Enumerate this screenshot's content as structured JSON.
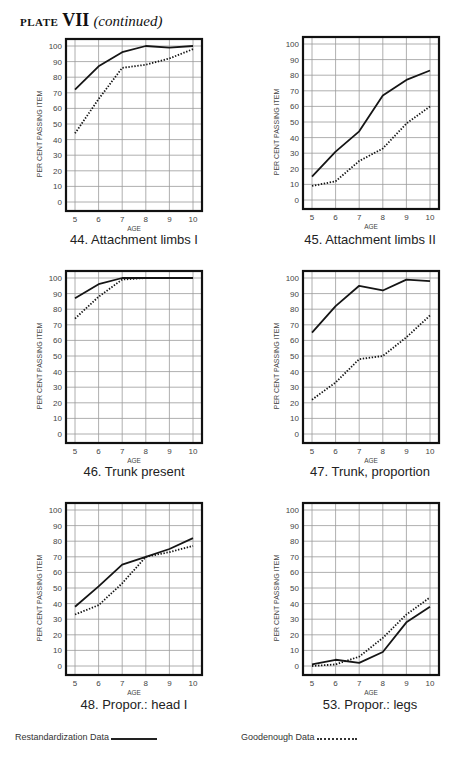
{
  "page": {
    "plate_label": "PLATE",
    "plate_number": "VII",
    "plate_suffix": "(continued)"
  },
  "legend": {
    "solid_label": "Restandardization Data",
    "dotted_label": "Goodenough Data"
  },
  "chart_data": [
    {
      "type": "line",
      "id": "44",
      "title": "44. Attachment limbs I",
      "xlabel": "AGE",
      "ylabel": "PER CENT PASSING ITEM",
      "x": [
        5,
        6,
        7,
        8,
        9,
        10
      ],
      "ylim": [
        0,
        100
      ],
      "yticks": [
        0,
        10,
        20,
        30,
        40,
        50,
        60,
        70,
        80,
        90,
        100
      ],
      "grid": true,
      "series": [
        {
          "name": "Restandardization Data",
          "style": "solid",
          "values": [
            72,
            87,
            96,
            100,
            99,
            100
          ]
        },
        {
          "name": "Goodenough Data",
          "style": "dotted",
          "values": [
            44,
            66,
            86,
            88,
            92,
            98
          ]
        }
      ]
    },
    {
      "type": "line",
      "id": "45",
      "title": "45. Attachment limbs II",
      "xlabel": "AGE",
      "ylabel": "PER CENT PASSING ITEM",
      "x": [
        5,
        6,
        7,
        8,
        9,
        10
      ],
      "ylim": [
        0,
        100
      ],
      "yticks": [
        0,
        10,
        20,
        30,
        40,
        50,
        60,
        70,
        80,
        90,
        100
      ],
      "grid": true,
      "series": [
        {
          "name": "Restandardization Data",
          "style": "solid",
          "values": [
            15,
            31,
            44,
            67,
            77,
            83
          ]
        },
        {
          "name": "Goodenough Data",
          "style": "dotted",
          "values": [
            9,
            12,
            25,
            33,
            49,
            60
          ]
        }
      ]
    },
    {
      "type": "line",
      "id": "46",
      "title": "46. Trunk present",
      "xlabel": "AGE",
      "ylabel": "PER CENT PASSING ITEM",
      "x": [
        5,
        6,
        7,
        8,
        9,
        10
      ],
      "ylim": [
        0,
        100
      ],
      "yticks": [
        0,
        10,
        20,
        30,
        40,
        50,
        60,
        70,
        80,
        90,
        100
      ],
      "grid": true,
      "series": [
        {
          "name": "Restandardization Data",
          "style": "solid",
          "values": [
            87,
            96,
            100,
            100,
            100,
            100
          ]
        },
        {
          "name": "Goodenough Data",
          "style": "dotted",
          "values": [
            74,
            88,
            99,
            100,
            100,
            100
          ]
        }
      ]
    },
    {
      "type": "line",
      "id": "47",
      "title": "47. Trunk, proportion",
      "xlabel": "AGE",
      "ylabel": "PER CENT PASSING ITEM",
      "x": [
        5,
        6,
        7,
        8,
        9,
        10
      ],
      "ylim": [
        0,
        100
      ],
      "yticks": [
        0,
        10,
        20,
        30,
        40,
        50,
        60,
        70,
        80,
        90,
        100
      ],
      "grid": true,
      "series": [
        {
          "name": "Restandardization Data",
          "style": "solid",
          "values": [
            65,
            82,
            95,
            92,
            99,
            98
          ]
        },
        {
          "name": "Goodenough Data",
          "style": "dotted",
          "values": [
            22,
            33,
            48,
            50,
            62,
            76
          ]
        }
      ]
    },
    {
      "type": "line",
      "id": "48",
      "title": "48. Propor.: head I",
      "xlabel": "AGE",
      "ylabel": "PER CENT PASSING ITEM",
      "x": [
        5,
        6,
        7,
        8,
        9,
        10
      ],
      "ylim": [
        0,
        100
      ],
      "yticks": [
        0,
        10,
        20,
        30,
        40,
        50,
        60,
        70,
        80,
        90,
        100
      ],
      "grid": true,
      "series": [
        {
          "name": "Restandardization Data",
          "style": "solid",
          "values": [
            38,
            51,
            65,
            70,
            75,
            82
          ]
        },
        {
          "name": "Goodenough Data",
          "style": "dotted",
          "values": [
            33,
            39,
            53,
            70,
            73,
            77
          ]
        }
      ]
    },
    {
      "type": "line",
      "id": "53",
      "title": "53. Propor.: legs",
      "xlabel": "AGE",
      "ylabel": "PER CENT PASSING ITEM",
      "x": [
        5,
        6,
        7,
        8,
        9,
        10
      ],
      "ylim": [
        0,
        100
      ],
      "yticks": [
        0,
        10,
        20,
        30,
        40,
        50,
        60,
        70,
        80,
        90,
        100
      ],
      "grid": true,
      "series": [
        {
          "name": "Restandardization Data",
          "style": "solid",
          "values": [
            1,
            4,
            2,
            9,
            28,
            38
          ]
        },
        {
          "name": "Goodenough Data",
          "style": "dotted",
          "values": [
            0,
            1,
            6,
            18,
            33,
            44
          ]
        }
      ]
    }
  ]
}
